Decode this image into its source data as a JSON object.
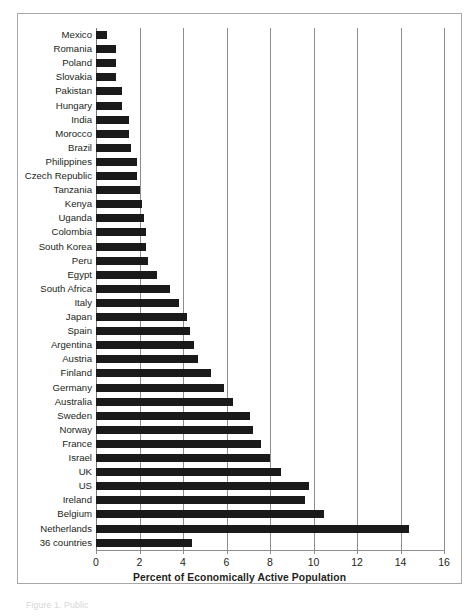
{
  "figure": {
    "bottom_caption": "Figure 1. Public",
    "frame_color": "#a8a8a8",
    "bar_color": "#1a1a1a",
    "gridline_color": "#8d8d8d"
  },
  "chart_data": {
    "type": "bar",
    "orientation": "horizontal",
    "title": "",
    "xlabel": "Percent of Economically Active Population",
    "ylabel": "",
    "xlim": [
      0,
      16
    ],
    "xticks": [
      0,
      2,
      4,
      6,
      8,
      10,
      12,
      14,
      16
    ],
    "xtick_labels": [
      "0",
      "2",
      "4",
      "6",
      "8",
      "10",
      "12",
      "14",
      "16"
    ],
    "grid": "vertical",
    "legend": "none",
    "categories": [
      "Mexico",
      "Romania",
      "Poland",
      "Slovakia",
      "Pakistan",
      "Hungary",
      "India",
      "Morocco",
      "Brazil",
      "Philippines",
      "Czech Republic",
      "Tanzania",
      "Kenya",
      "Uganda",
      "Colombia",
      "South Korea",
      "Peru",
      "Egypt",
      "South Africa",
      "Italy",
      "Japan",
      "Spain",
      "Argentina",
      "Austria",
      "Finland",
      "Germany",
      "Australia",
      "Sweden",
      "Norway",
      "France",
      "Israel",
      "UK",
      "US",
      "Ireland",
      "Belgium",
      "Netherlands",
      "36 countries"
    ],
    "values": [
      0.5,
      0.9,
      0.9,
      0.9,
      1.2,
      1.2,
      1.5,
      1.5,
      1.6,
      1.9,
      1.9,
      2.0,
      2.1,
      2.2,
      2.3,
      2.3,
      2.4,
      2.8,
      3.4,
      3.8,
      4.2,
      4.3,
      4.5,
      4.7,
      5.3,
      5.9,
      6.3,
      7.1,
      7.2,
      7.6,
      8.0,
      8.5,
      9.8,
      9.6,
      10.5,
      14.4,
      4.4
    ]
  }
}
